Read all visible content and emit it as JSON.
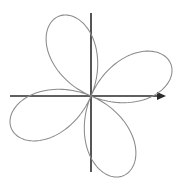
{
  "figure": {
    "name": "four-petal-rose-curve",
    "background_color": "#ffffff",
    "width": 179,
    "height": 181
  },
  "axes": {
    "origin": {
      "x": 91,
      "y": 96
    },
    "x_axis": {
      "label": "x-axis",
      "start_x": 10,
      "end_x": 166,
      "y": 96,
      "color": "#2b2b2b",
      "has_arrow_end": true,
      "has_arrow_start": false
    },
    "y_axis": {
      "label": "y-axis",
      "start_y": 13,
      "end_y": 172,
      "x": 91,
      "color": "#2b2b2b",
      "has_arrow_end": false,
      "has_arrow_start": false
    },
    "tick_labels": [],
    "grid": false
  },
  "chart_data": {
    "type": "line",
    "title": "",
    "subtitle": "",
    "xlabel": "",
    "ylabel": "",
    "curve_name": "four-petal rose",
    "curve_color": "#8a8a8a",
    "polar_equation": "r = a*cos(2*(theta - phi))",
    "petal_count": 4,
    "amplitude_px": 86,
    "rotation_deg": 22,
    "theta_range_deg": [
      0,
      360
    ],
    "theta_step_deg": 1,
    "grid": false,
    "legend": "none",
    "petals": [
      {
        "name": "upper-left-petal",
        "axis_angle_deg": 112,
        "tip_x": 62,
        "tip_y": 25,
        "length_px": 75,
        "width": "narrow"
      },
      {
        "name": "upper-right-petal",
        "axis_angle_deg": 22,
        "tip_x": 155,
        "tip_y": 63,
        "length_px": 70,
        "width": "wide"
      },
      {
        "name": "lower-left-petal",
        "axis_angle_deg": 202,
        "tip_x": 25,
        "tip_y": 122,
        "length_px": 70,
        "width": "wide"
      },
      {
        "name": "lower-right-petal",
        "axis_angle_deg": 292,
        "tip_x": 117,
        "tip_y": 165,
        "length_px": 75,
        "width": "narrow"
      }
    ]
  }
}
